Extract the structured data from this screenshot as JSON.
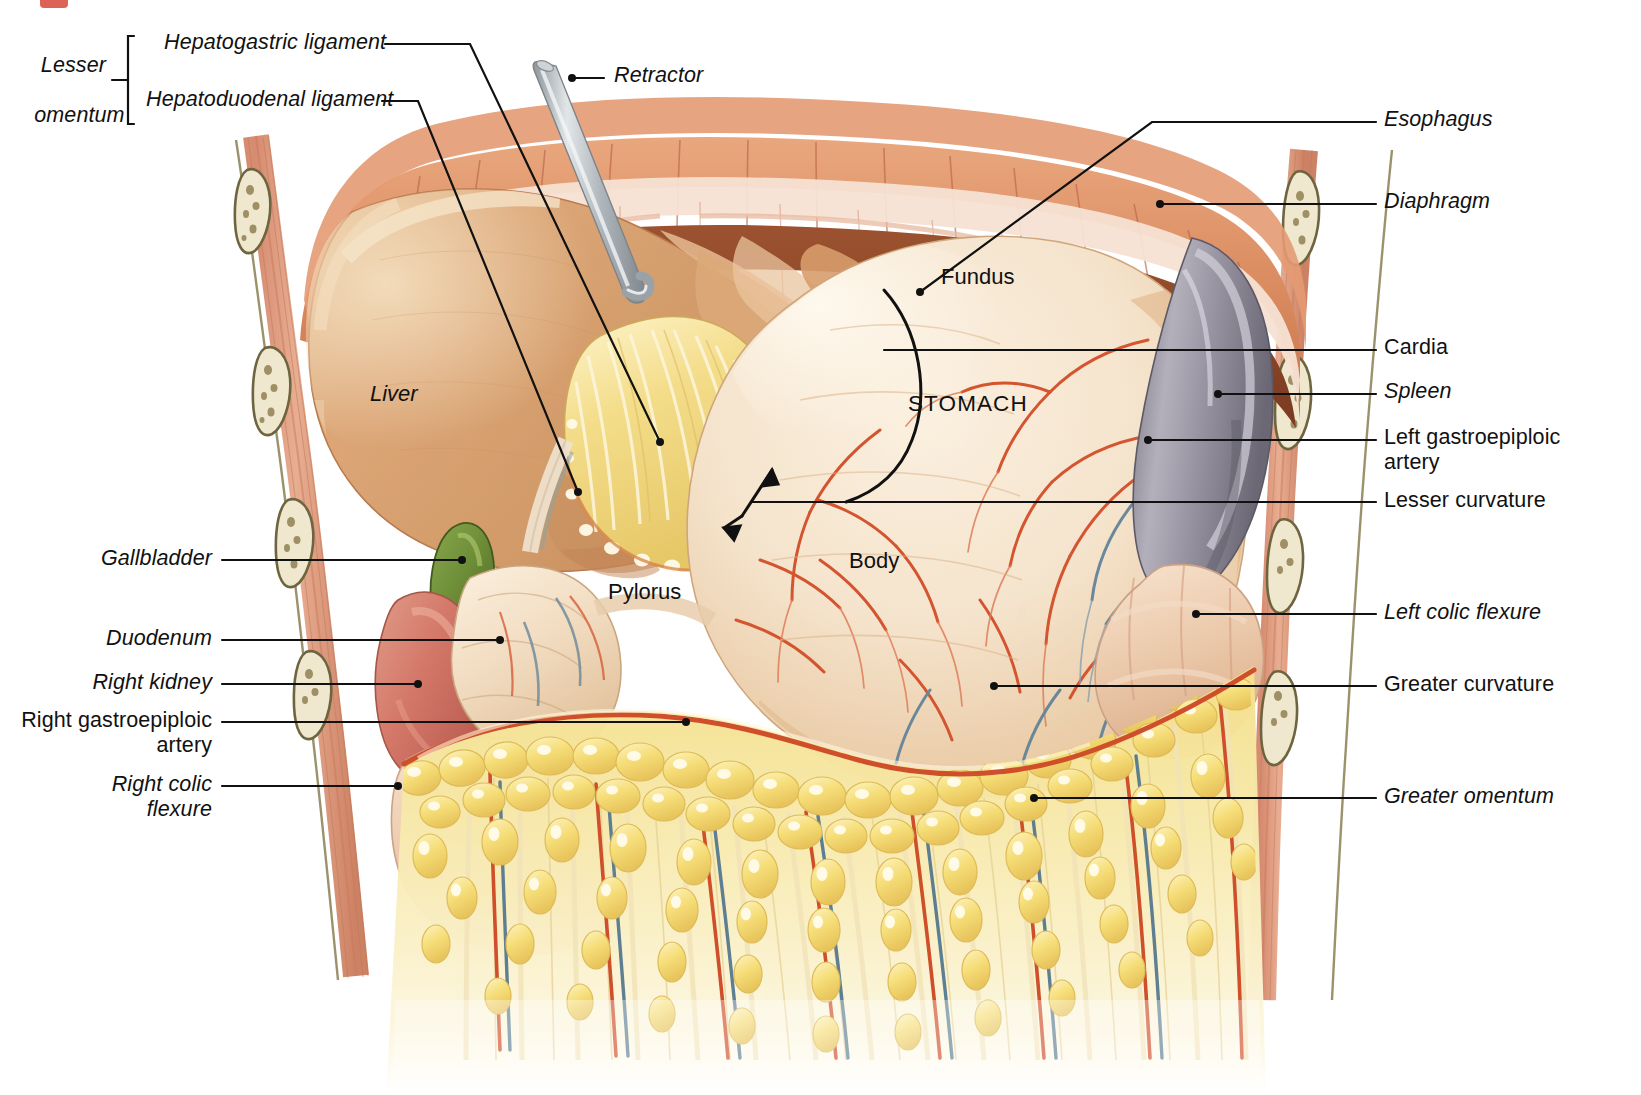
{
  "figure": {
    "corner_mark": ""
  },
  "bracket_group": {
    "group_label_line1": "Lesser",
    "group_label_line2": "omentum",
    "members": [
      {
        "id": "hepatogastric",
        "label": "Hepatogastric ligament"
      },
      {
        "id": "hepatoduodenal",
        "label": "Hepatoduodenal ligament"
      }
    ]
  },
  "labels_left": [
    {
      "id": "gallbladder",
      "label": "Gallbladder",
      "style": "italic"
    },
    {
      "id": "duodenum",
      "label": "Duodenum",
      "style": "italic"
    },
    {
      "id": "right-kidney",
      "label": "Right kidney",
      "style": "italic"
    },
    {
      "id": "right-gastroepiploic-artery",
      "label": "Right gastroepiploic\nartery",
      "style": "roman"
    },
    {
      "id": "right-colic-flexure",
      "label": "Right colic\nflexure",
      "style": "italic"
    }
  ],
  "labels_top": [
    {
      "id": "retractor",
      "label": "Retractor",
      "style": "italic"
    }
  ],
  "labels_right": [
    {
      "id": "esophagus",
      "label": "Esophagus",
      "style": "italic"
    },
    {
      "id": "diaphragm",
      "label": "Diaphragm",
      "style": "italic"
    },
    {
      "id": "cardia",
      "label": "Cardia",
      "style": "roman"
    },
    {
      "id": "spleen",
      "label": "Spleen",
      "style": "italic"
    },
    {
      "id": "left-gastroepiploic-artery",
      "label": "Left gastroepiploic\nartery",
      "style": "roman"
    },
    {
      "id": "lesser-curvature",
      "label": "Lesser curvature",
      "style": "roman"
    },
    {
      "id": "left-colic-flexure",
      "label": "Left colic flexure",
      "style": "italic"
    },
    {
      "id": "greater-curvature",
      "label": "Greater curvature",
      "style": "roman"
    },
    {
      "id": "greater-omentum",
      "label": "Greater omentum",
      "style": "italic"
    }
  ],
  "organ_labels": [
    {
      "id": "liver",
      "label": "Liver",
      "style": "italic"
    },
    {
      "id": "fundus",
      "label": "Fundus",
      "style": "roman"
    },
    {
      "id": "stomach",
      "label": "STOMACH",
      "style": "caps"
    },
    {
      "id": "body",
      "label": "Body",
      "style": "roman"
    },
    {
      "id": "pylorus",
      "label": "Pylorus",
      "style": "roman"
    }
  ],
  "colors": {
    "leader_line": "#111111",
    "liver": "#d9a070",
    "liver_highlight": "#edd0ae",
    "stomach": "#f4e3cd",
    "stomach_shadow": "#e2b98f",
    "spleen": "#8a8794",
    "spleen_light": "#b6b2bd",
    "gallbladder": "#6e8c3a",
    "kidney": "#d97f6e",
    "omentum_fat": "#f5dd7e",
    "omentum_fat_light": "#fdf2bf",
    "artery_red": "#d4492a",
    "vein_blue": "#5f7f92",
    "muscle_wall": "#d98a62",
    "muscle_dark": "#8c4a2b",
    "rib_bone": "#efe8cf",
    "rib_outline": "#6e6540",
    "retractor_metal": "#b8bdc2",
    "corner_red": "#d8483a",
    "background": "#ffffff"
  }
}
